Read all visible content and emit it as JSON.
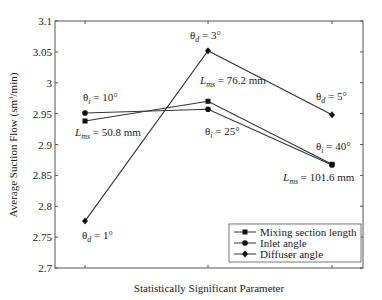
{
  "chart_data": {
    "type": "line",
    "title": "",
    "xlabel": "Statistically Significant Parameter",
    "ylabel": "Average Suction Flow (sm³/min)",
    "ylabel_parts": {
      "main": "Average Suction Flow (sm",
      "sup": "3",
      "tail": "/min)"
    },
    "ylim": [
      2.7,
      3.1
    ],
    "yticks": [
      "3.1",
      "3.05",
      "3",
      "2.95",
      "2.9",
      "2.85",
      "2.8",
      "2.75",
      "2.7"
    ],
    "ytick_values": [
      3.1,
      3.05,
      3.0,
      2.95,
      2.9,
      2.85,
      2.8,
      2.75,
      2.7
    ],
    "x": [
      1,
      2,
      3
    ],
    "xtick_labels": [
      "",
      "",
      ""
    ],
    "grid": false,
    "legend_position": "lower right",
    "series": [
      {
        "name": "Mixing section length",
        "marker": "square",
        "values": [
          2.938,
          2.97,
          2.868
        ]
      },
      {
        "name": "Inlet angle",
        "marker": "circle",
        "values": [
          2.951,
          2.957,
          2.867
        ]
      },
      {
        "name": "Diffuser angle",
        "marker": "diamond",
        "values": [
          2.776,
          3.052,
          2.948
        ]
      }
    ],
    "annotations": [
      {
        "text_main": "θ",
        "sub": "i",
        "text_tail": " = 10°",
        "x": 83,
        "y": 101
      },
      {
        "text_main": "L",
        "sub": "ms",
        "text_tail": " = 50.8 mm",
        "x": 75,
        "y": 136
      },
      {
        "text_main": "θ",
        "sub": "d",
        "text_tail": " = 1°",
        "x": 82,
        "y": 239
      },
      {
        "text_main": "θ",
        "sub": "d",
        "text_tail": " = 3°",
        "x": 190,
        "y": 39
      },
      {
        "text_main": "L",
        "sub": "ms",
        "text_tail": " = 76.2 mm",
        "x": 200,
        "y": 84
      },
      {
        "text_main": "θ",
        "sub": "i",
        "text_tail": " = 25°",
        "x": 205,
        "y": 135
      },
      {
        "text_main": "θ",
        "sub": "d",
        "text_tail": " = 5°",
        "x": 316,
        "y": 100
      },
      {
        "text_main": "θ",
        "sub": "i",
        "text_tail": " = 40°",
        "x": 316,
        "y": 150
      },
      {
        "text_main": "L",
        "sub": "ms",
        "text_tail": " = 101.6 mm",
        "x": 283,
        "y": 181
      }
    ]
  }
}
